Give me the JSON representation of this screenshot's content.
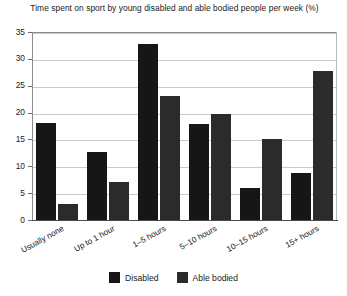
{
  "chart_data": {
    "type": "bar",
    "title": "Time spent on sport by young disabled and able bodied people per week (%)",
    "xlabel": "",
    "ylabel": "",
    "ylim": [
      0,
      35
    ],
    "ytick_step": 5,
    "yticks": [
      0,
      5,
      10,
      15,
      20,
      25,
      30,
      35
    ],
    "ytick_labels": [
      "0",
      "5",
      "10",
      "15",
      "20",
      "25",
      "30",
      "35"
    ],
    "grid": true,
    "legend_position": "bottom-center",
    "categories": [
      "Usually none",
      "Up to 1 hour",
      "1–5 hours",
      "5–10 hours",
      "10–15 hours",
      "15+ hours"
    ],
    "series": [
      {
        "name": "Disabled",
        "color": "#161616",
        "values": [
          18.0,
          12.7,
          32.7,
          17.8,
          6.0,
          8.8
        ]
      },
      {
        "name": "Able bodied",
        "color": "#2b2b2b",
        "values": [
          3.0,
          7.0,
          23.0,
          19.7,
          15.0,
          27.8
        ]
      }
    ]
  }
}
